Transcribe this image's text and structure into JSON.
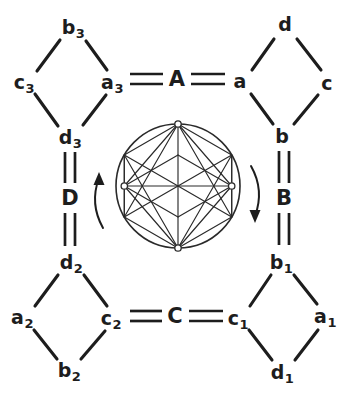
{
  "figure": {
    "background": "#ffffff",
    "ink": "#1d1d1d"
  },
  "blocks": [
    {
      "id": "top-left",
      "name": "diamond-top-left",
      "vertices": [
        {
          "id": "b3",
          "base": "b",
          "sub": "3",
          "pos": "top",
          "x": 73,
          "y": 27
        },
        {
          "id": "c3",
          "base": "c",
          "sub": "3",
          "pos": "left",
          "x": 24,
          "y": 82
        },
        {
          "id": "a3",
          "base": "a",
          "sub": "3",
          "pos": "right",
          "x": 112,
          "y": 82
        },
        {
          "id": "d3",
          "base": "d",
          "sub": "3",
          "pos": "bottom",
          "x": 70,
          "y": 137
        }
      ]
    },
    {
      "id": "top-right",
      "name": "diamond-top-right",
      "vertices": [
        {
          "id": "d",
          "base": "d",
          "sub": "",
          "pos": "top",
          "x": 285,
          "y": 24
        },
        {
          "id": "a",
          "base": "a",
          "sub": "",
          "pos": "left",
          "x": 240,
          "y": 81
        },
        {
          "id": "c",
          "base": "c",
          "sub": "",
          "pos": "right",
          "x": 327,
          "y": 83
        },
        {
          "id": "b",
          "base": "b",
          "sub": "",
          "pos": "bottom",
          "x": 282,
          "y": 136
        }
      ]
    },
    {
      "id": "bottom-left",
      "name": "diamond-bottom-left",
      "vertices": [
        {
          "id": "d2",
          "base": "d",
          "sub": "2",
          "pos": "top",
          "x": 71,
          "y": 262
        },
        {
          "id": "a2",
          "base": "a",
          "sub": "2",
          "pos": "left",
          "x": 22,
          "y": 317
        },
        {
          "id": "c2",
          "base": "c",
          "sub": "2",
          "pos": "right",
          "x": 111,
          "y": 318
        },
        {
          "id": "b2",
          "base": "b",
          "sub": "2",
          "pos": "bottom",
          "x": 69,
          "y": 370
        }
      ]
    },
    {
      "id": "bottom-right",
      "name": "diamond-bottom-right",
      "vertices": [
        {
          "id": "b1",
          "base": "b",
          "sub": "1",
          "pos": "top",
          "x": 281,
          "y": 262
        },
        {
          "id": "c1",
          "base": "c",
          "sub": "1",
          "pos": "left",
          "x": 238,
          "y": 318
        },
        {
          "id": "a1",
          "base": "a",
          "sub": "1",
          "pos": "right",
          "x": 325,
          "y": 316
        },
        {
          "id": "d1",
          "base": "d",
          "sub": "1",
          "pos": "bottom",
          "x": 282,
          "y": 372
        }
      ]
    }
  ],
  "relations": [
    {
      "id": "A",
      "label": "A",
      "orientation": "horizontal",
      "x": 177,
      "y": 79,
      "connects": [
        "a3",
        "a"
      ]
    },
    {
      "id": "B",
      "label": "B",
      "orientation": "vertical",
      "x": 284,
      "y": 198,
      "connects": [
        "b",
        "b1"
      ]
    },
    {
      "id": "C",
      "label": "C",
      "orientation": "horizontal",
      "x": 175,
      "y": 316,
      "connects": [
        "c2",
        "c1"
      ]
    },
    {
      "id": "D",
      "label": "D",
      "orientation": "vertical",
      "x": 70,
      "y": 198,
      "connects": [
        "d3",
        "d2"
      ]
    }
  ],
  "center_graph": {
    "name": "circulant-graph",
    "shape": "circle",
    "center_x": 178,
    "center_y": 186,
    "radius": 62,
    "node_count": 6,
    "marked_nodes": [
      "top",
      "left",
      "right",
      "bottom"
    ]
  },
  "rotation_arrows": [
    {
      "id": "left-arrow",
      "direction": "up",
      "side": "left"
    },
    {
      "id": "right-arrow",
      "direction": "down",
      "side": "right"
    }
  ]
}
